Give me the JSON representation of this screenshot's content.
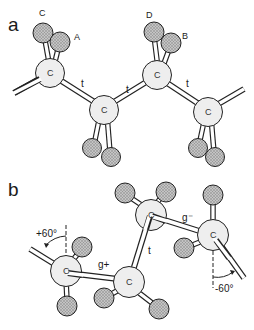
{
  "figure": {
    "panels": [
      {
        "id": "a",
        "label": "a",
        "description": "all-trans chain conformation",
        "atom_labels": {
          "C": "C",
          "A": "A",
          "D": "D",
          "B": "B"
        },
        "carbons": [
          "C",
          "C",
          "C",
          "C"
        ],
        "bonds": [
          "t",
          "t",
          "t"
        ]
      },
      {
        "id": "b",
        "label": "b",
        "description": "gauche+ / trans / gauche- conformation",
        "carbons": [
          "C",
          "C",
          "C",
          "C"
        ],
        "bonds": [
          "g+",
          "t",
          "g⁻"
        ],
        "angles": [
          "+60°",
          "-60°"
        ]
      }
    ],
    "colors": {
      "carbon_fill": "#eeeeee",
      "substituent_fill": "#b0b0b0",
      "outline": "#222222",
      "background": "#ffffff"
    }
  }
}
